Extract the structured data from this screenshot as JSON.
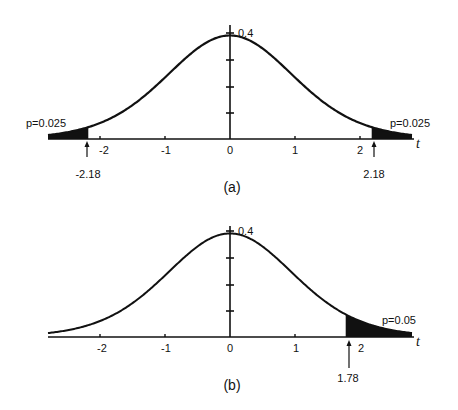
{
  "chart_data": [
    {
      "type": "area",
      "panel": "(a)",
      "title": "",
      "distribution": "Student t, df=12",
      "df": 12,
      "xlabel": "t",
      "ylabel": "",
      "xlim": [
        -2.8,
        2.8
      ],
      "ylim": [
        0,
        0.4
      ],
      "x_ticks": [
        -2,
        -1,
        0,
        1,
        2
      ],
      "x_tick_labels": [
        "-2",
        "-1",
        "0",
        "1",
        "2"
      ],
      "y_ticks": [
        0.1,
        0.2,
        0.3,
        0.4
      ],
      "y_tick_labels": [
        "0.4"
      ],
      "peak_density": 0.35,
      "shaded_regions": [
        {
          "from": -2.8,
          "to": -2.18,
          "p": 0.025,
          "label": "p=0.025"
        },
        {
          "from": 2.18,
          "to": 2.8,
          "p": 0.025,
          "label": "p=0.025"
        }
      ],
      "annotations": [
        {
          "text": "-2.18",
          "x": -2.18,
          "type": "arrow"
        },
        {
          "text": "2.18",
          "x": 2.18,
          "type": "arrow"
        }
      ],
      "caption": "(a)",
      "grid": false
    },
    {
      "type": "area",
      "panel": "(b)",
      "title": "",
      "distribution": "Student t, df=12",
      "df": 12,
      "xlabel": "t",
      "ylabel": "",
      "xlim": [
        -2.8,
        2.8
      ],
      "ylim": [
        0,
        0.4
      ],
      "x_ticks": [
        -2,
        -1,
        0,
        1,
        2
      ],
      "x_tick_labels": [
        "-2",
        "-1",
        "0",
        "1",
        "2"
      ],
      "y_ticks": [
        0.1,
        0.2,
        0.3,
        0.4
      ],
      "y_tick_labels": [
        "0.4"
      ],
      "peak_density": 0.35,
      "shaded_regions": [
        {
          "from": 1.78,
          "to": 2.8,
          "p": 0.05,
          "label": "p=0.05"
        }
      ],
      "annotations": [
        {
          "text": "1.78",
          "x": 1.78,
          "type": "arrow"
        }
      ],
      "caption": "(b)",
      "grid": false
    }
  ],
  "panels": {
    "a": {
      "ytick_label": "0.4",
      "xaxis_label": "t",
      "ticks": [
        "-2",
        "-1",
        "0",
        "1",
        "2"
      ],
      "left_p": "p=0.025",
      "right_p": "p=0.025",
      "left_crit": "-2.18",
      "right_crit": "2.18",
      "caption": "(a)"
    },
    "b": {
      "ytick_label": "0.4",
      "xaxis_label": "t",
      "ticks": [
        "-2",
        "-1",
        "0",
        "1",
        "2"
      ],
      "right_p": "p=0.05",
      "right_crit": "1.78",
      "caption": "(b)"
    }
  },
  "style": {
    "ink": "#111111",
    "background": "#ffffff"
  }
}
